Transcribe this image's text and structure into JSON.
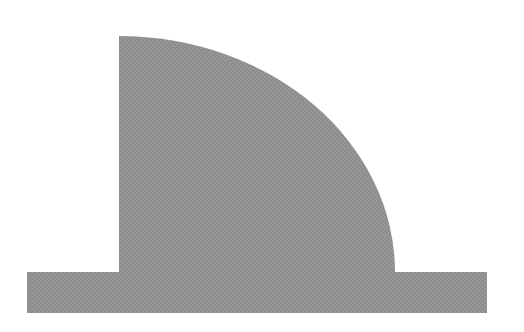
{
  "figure": {
    "background_color": "#ffffff",
    "fill_color": "#8d8d8d",
    "dot_color": "#a3a3a3",
    "shape": {
      "base_rect": {
        "x": 27,
        "y": 272,
        "width": 460,
        "height": 41
      },
      "quarter_ellipse": {
        "cx": 119,
        "cy": 272,
        "rx": 276,
        "ry": 236
      }
    }
  }
}
